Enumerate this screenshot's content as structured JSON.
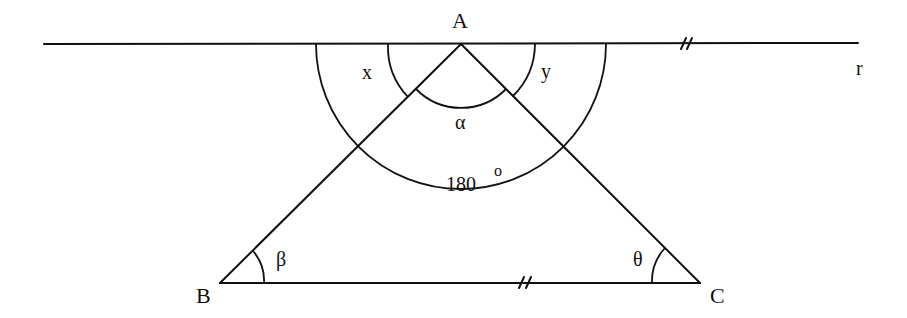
{
  "diagram": {
    "type": "geometry",
    "points": {
      "A": {
        "label": "A",
        "x": 461,
        "y": 44
      },
      "B": {
        "label": "B",
        "x": 220,
        "y": 283
      },
      "C": {
        "label": "C",
        "x": 700,
        "y": 283
      }
    },
    "line_r": {
      "label": "r",
      "x1": 44,
      "y1": 44,
      "x2": 858,
      "y2": 43
    },
    "parallel_marks": {
      "on_line_r": "//",
      "on_segment_BC": "//"
    },
    "angles": {
      "x": {
        "label": "x",
        "vertex": "A",
        "desc": "between line r (left) and AB"
      },
      "y": {
        "label": "y",
        "vertex": "A",
        "desc": "between AC and line r (right)"
      },
      "alpha": {
        "label": "α",
        "vertex": "A",
        "desc": "angle BAC"
      },
      "straight": {
        "label": "180",
        "degree_mark": "o",
        "vertex": "A",
        "desc": "straight angle x + α + y"
      },
      "beta": {
        "label": "β",
        "vertex": "B"
      },
      "theta": {
        "label": "θ",
        "vertex": "C"
      }
    }
  }
}
